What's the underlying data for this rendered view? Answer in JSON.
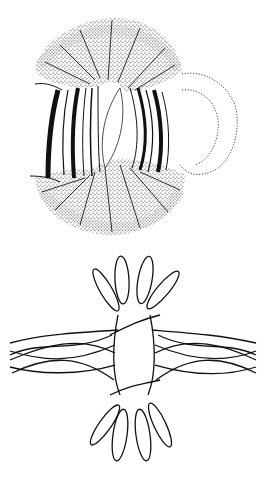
{
  "figures": [
    {
      "id": "top",
      "description": "Stippled bilobed structure with dark curved bands on left and right sides around a central clear lens-shaped region, and a dotted-outline lobe extending to the right",
      "colors": {
        "ink": "#111111",
        "background": "#ffffff"
      }
    },
    {
      "id": "bottom",
      "description": "Line drawing of interwoven looping strands forming a cross pattern: three elongated petal loops above and below, braided strands extending left and right around a central open oval",
      "colors": {
        "ink": "#111111",
        "background": "#ffffff"
      }
    }
  ]
}
